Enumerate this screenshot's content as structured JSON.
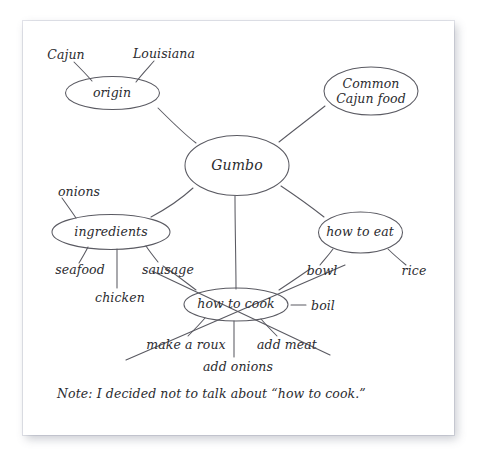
{
  "document": {
    "type": "hand-drawn mind map on white paper",
    "note": "Note: I decided not to talk about “how to cook.”"
  },
  "map": {
    "center": {
      "label": "Gumbo"
    },
    "nodes": [
      {
        "id": "origin",
        "label": "origin"
      },
      {
        "id": "common-cajun-food",
        "label": "Common\nCajun food",
        "line1": "Common",
        "line2": "Cajun food"
      },
      {
        "id": "ingredients",
        "label": "ingredients"
      },
      {
        "id": "how-to-eat",
        "label": "how to eat"
      },
      {
        "id": "how-to-cook",
        "label": "how to cook",
        "struck_out": true
      }
    ],
    "leaves": [
      {
        "id": "cajun",
        "label": "Cajun",
        "parent": "origin"
      },
      {
        "id": "louisiana",
        "label": "Louisiana",
        "parent": "origin"
      },
      {
        "id": "onions",
        "label": "onions",
        "parent": "ingredients"
      },
      {
        "id": "seafood",
        "label": "seafood",
        "parent": "ingredients"
      },
      {
        "id": "chicken",
        "label": "chicken",
        "parent": "ingredients"
      },
      {
        "id": "sausage",
        "label": "sausage",
        "parent": "ingredients"
      },
      {
        "id": "bowl",
        "label": "bowl",
        "parent": "how-to-eat"
      },
      {
        "id": "rice",
        "label": "rice",
        "parent": "how-to-eat"
      },
      {
        "id": "boil",
        "label": "boil",
        "parent": "how-to-cook"
      },
      {
        "id": "make-a-roux",
        "label": "make a roux",
        "parent": "how-to-cook"
      },
      {
        "id": "add-meat",
        "label": "add meat",
        "parent": "how-to-cook"
      },
      {
        "id": "add-onions",
        "label": "add onions",
        "parent": "how-to-cook"
      }
    ]
  },
  "colors": {
    "ink": "#2b2b2f",
    "stroke": "#5a5a62",
    "paper": "#ffffff",
    "background": "#ffffff"
  }
}
